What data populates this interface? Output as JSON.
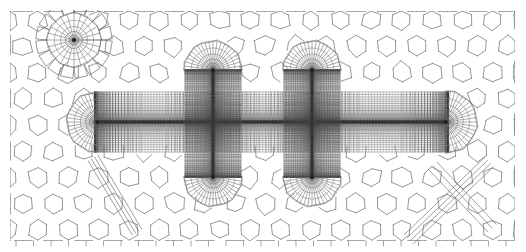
{
  "figure": {
    "kind": "finite-element-mesh",
    "width": 526,
    "height": 252,
    "background_color": "#ffffff",
    "line_color": "#6a6a6a",
    "dense_line_color": "#4a4a4a",
    "crack_line_color": "#2b2b2b",
    "caption": ""
  },
  "domain": {
    "x0": 10,
    "y0": 11,
    "x1": 515,
    "y1": 241,
    "border_visible": false
  },
  "background_mesh": {
    "type": "voronoi-hexagonal",
    "cell_shape": "hexagon",
    "cell_size": 17.5,
    "jitter": 0.16,
    "line_width": 0.7,
    "description": "quasi-regular honeycomb polygonal cells filling the whole domain"
  },
  "crack_bands": [
    {
      "name": "horizontal-main-crack-band",
      "orientation": "horizontal",
      "x_start": 95,
      "x_end": 448,
      "y_center": 122,
      "half_height": 30,
      "n_transverse": 26,
      "n_longitudinal": 120,
      "graded": true,
      "core_darkness": 0.95
    },
    {
      "name": "vertical-crack-band-left",
      "orientation": "vertical",
      "x_center": 213,
      "y_start": 70,
      "y_end": 177,
      "half_width": 28,
      "n_transverse": 24,
      "n_longitudinal": 62,
      "graded": true,
      "core_darkness": 0.9
    },
    {
      "name": "vertical-crack-band-right",
      "orientation": "vertical",
      "x_center": 312,
      "y_start": 70,
      "y_end": 177,
      "half_width": 28,
      "n_transverse": 24,
      "n_longitudinal": 62,
      "graded": true,
      "core_darkness": 0.9
    }
  ],
  "crack_tip_rosettes": [
    {
      "name": "rosette-isolated-upper-left",
      "cx": 74,
      "cy": 40,
      "r": 27,
      "rings": 7,
      "sectors": 24,
      "full_circle": true
    },
    {
      "name": "rosette-left-tip-horizontal",
      "cx": 97,
      "cy": 122,
      "r": 30,
      "rings": 8,
      "sectors": 22,
      "full_circle": false,
      "open_dir": "right"
    },
    {
      "name": "rosette-right-tip-horizontal",
      "cx": 446,
      "cy": 122,
      "r": 31,
      "rings": 8,
      "sectors": 22,
      "full_circle": false,
      "open_dir": "left"
    },
    {
      "name": "rosette-top-tip-left-vertical",
      "cx": 213,
      "cy": 70,
      "r": 29,
      "rings": 8,
      "sectors": 22,
      "full_circle": false,
      "open_dir": "down"
    },
    {
      "name": "rosette-bottom-tip-left-vertical",
      "cx": 213,
      "cy": 177,
      "r": 29,
      "rings": 8,
      "sectors": 22,
      "full_circle": false,
      "open_dir": "up"
    },
    {
      "name": "rosette-top-tip-right-vertical",
      "cx": 312,
      "cy": 70,
      "r": 29,
      "rings": 8,
      "sectors": 22,
      "full_circle": false,
      "open_dir": "down"
    },
    {
      "name": "rosette-bottom-tip-right-vertical",
      "cx": 312,
      "cy": 177,
      "r": 29,
      "rings": 8,
      "sectors": 22,
      "full_circle": false,
      "open_dir": "up"
    }
  ],
  "diagonal_bands": [
    {
      "name": "diagonal-band-lower-left",
      "x1": 93,
      "y1": 158,
      "x2": 137,
      "y2": 232,
      "n_lines": 4,
      "spread": 7
    },
    {
      "name": "diagonal-band-lower-right-a",
      "x1": 489,
      "y1": 162,
      "x2": 409,
      "y2": 239,
      "n_lines": 4,
      "spread": 8
    },
    {
      "name": "diagonal-band-lower-right-b",
      "x1": 433,
      "y1": 166,
      "x2": 492,
      "y2": 228,
      "n_lines": 3,
      "spread": 7
    }
  ],
  "boundary_ticks": {
    "name": "bottom-boundary-tick-marks",
    "edge": "bottom",
    "y": 241,
    "length": 5,
    "spacing": 17.5,
    "count": 29
  }
}
